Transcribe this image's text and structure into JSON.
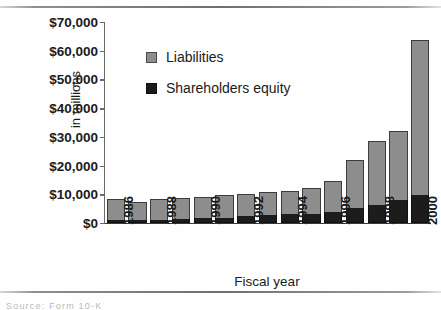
{
  "chart_data": {
    "type": "bar",
    "subtype": "stacked-vertical",
    "title": "",
    "xlabel": "Fiscal year",
    "ylabel": "in millions",
    "ylim": [
      0,
      70000
    ],
    "ytick_step": 10000,
    "grid": false,
    "legend_position": "inside-upper-left",
    "categories": [
      "1986",
      "1987",
      "1988",
      "1989",
      "1990",
      "1991",
      "1992",
      "1993",
      "1994",
      "1995",
      "1996",
      "1997",
      "1998",
      "1999",
      "2000"
    ],
    "tick_labels_shown": [
      "1986",
      "1988",
      "1990",
      "1992",
      "1994",
      "1996",
      "1998",
      "2000"
    ],
    "ytick_labels": [
      "$0",
      "$10,000",
      "$20,000",
      "$30,000",
      "$40,000",
      "$50,000",
      "$60,000",
      "$70,000"
    ],
    "series": [
      {
        "name": "Shareholders equity",
        "color": "#1c1c1c",
        "values": [
          1100,
          900,
          1100,
          1400,
          1600,
          1900,
          2300,
          2800,
          3000,
          3300,
          3800,
          5100,
          6300,
          8000,
          9900
        ]
      },
      {
        "name": "Liabilities",
        "color": "#8d8d8d",
        "values": [
          7300,
          6500,
          7200,
          7200,
          7400,
          7700,
          7700,
          8000,
          8300,
          8800,
          11000,
          16700,
          22100,
          24200,
          53900
        ]
      }
    ],
    "totals": [
      8400,
      7400,
      8300,
      8600,
      9000,
      9600,
      10000,
      10800,
      11300,
      12100,
      14800,
      21800,
      28400,
      32200,
      63800
    ],
    "annotations": []
  },
  "legend": {
    "items": [
      {
        "label": "Liabilities",
        "swatch": "gray-square"
      },
      {
        "label": "Shareholders equity",
        "swatch": "black-square"
      }
    ]
  },
  "axes": {
    "y_title": "in millions",
    "x_title": "Fiscal year"
  },
  "footer": {
    "source_line": "Source: Form 10-K"
  },
  "colors": {
    "liabilities": "#8d8d8d",
    "equity": "#1c1c1c",
    "axis": "#3a3a3a",
    "page": "#fefefe"
  }
}
